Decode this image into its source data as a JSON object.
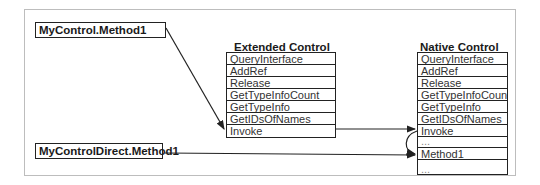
{
  "diagram": {
    "callers": {
      "method1": "MyControl.Method1",
      "direct": "MyControlDirect.Method1"
    },
    "extended_control": {
      "title": "Extended Control",
      "rows": [
        "QueryInterface",
        "AddRef",
        "Release",
        "GetTypeInfoCount",
        "GetTypeInfo",
        "GetIDsOfNames",
        "Invoke"
      ]
    },
    "native_control": {
      "title": "Native Control",
      "rows": [
        "QueryInterface",
        "AddRef",
        "Release",
        "GetTypeInfoCount",
        "GetTypeInfo",
        "GetIDsOfNames",
        "Invoke",
        "...",
        "Method1",
        "..."
      ]
    },
    "colors": {
      "line": "#222222",
      "frame": "#bdbdbd"
    }
  }
}
